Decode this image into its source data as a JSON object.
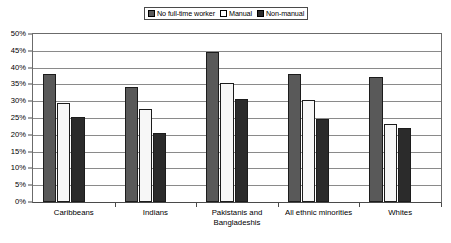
{
  "chart_data": {
    "type": "bar",
    "title": "",
    "subtitle": "",
    "xlabel": "",
    "ylabel": "",
    "ylim": [
      0,
      50
    ],
    "y_tick_step": 5,
    "y_tick_labels": [
      "50%",
      "45%",
      "40%",
      "35%",
      "30%",
      "25%",
      "20%",
      "15%",
      "10%",
      "5%",
      "0%"
    ],
    "y_tick_values": [
      50,
      45,
      40,
      35,
      30,
      25,
      20,
      15,
      10,
      5,
      0
    ],
    "grid": true,
    "grid_axis": "y",
    "legend_position": "top-center",
    "categories": [
      "Caribbeans",
      "Indians",
      "Pakistanis and Bangladeshis",
      "All ethnic minorities",
      "Whites"
    ],
    "category_lines": [
      [
        "Caribbeans"
      ],
      [
        "Indians"
      ],
      [
        "Pakistanis and",
        "Bangladeshis"
      ],
      [
        "All ethnic minorities"
      ],
      [
        "Whites"
      ]
    ],
    "series": [
      {
        "name": "No full-time worker",
        "color": "#595959",
        "values": [
          38.2,
          34.1,
          44.6,
          38.2,
          37.3
        ]
      },
      {
        "name": "Manual",
        "color": "#f7f7f7",
        "values": [
          29.6,
          27.8,
          35.4,
          30.4,
          23.1
        ]
      },
      {
        "name": "Non-manual",
        "color": "#2b2b2b",
        "values": [
          25.2,
          20.4,
          30.6,
          24.7,
          22.0
        ]
      }
    ]
  },
  "legend": {
    "items": [
      {
        "label": "No full-time worker",
        "swatch_color": "#595959"
      },
      {
        "label": "Manual",
        "swatch_color": "#ffffff"
      },
      {
        "label": "Non-manual",
        "swatch_color": "#2b2b2b"
      }
    ]
  },
  "colors": {
    "plot_background": "#ffffff",
    "gridline": "#8a8a8a",
    "axis": "#4a4a4a",
    "bar_outline": "#1c1c1c"
  }
}
